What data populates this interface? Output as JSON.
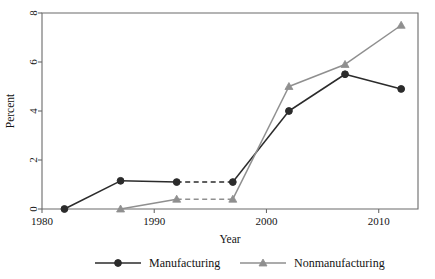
{
  "chart_data": {
    "type": "line",
    "title": "",
    "subtitle": "",
    "xlabel": "Year",
    "ylabel": "Percent",
    "xlim": [
      1980.0,
      2013.5
    ],
    "ylim": [
      0,
      8
    ],
    "xticks": [
      1980,
      1990,
      2000,
      2010
    ],
    "xtick_labels": [
      "1980",
      "1990",
      "2000",
      "2010"
    ],
    "yticks": [
      0,
      2,
      4,
      6,
      8
    ],
    "ytick_labels": [
      "0",
      "2",
      "4",
      "6",
      "8"
    ],
    "grid": false,
    "legend_position": "bottom-outside",
    "series": [
      {
        "name": "Manufacturing",
        "color": "#2b2b2b",
        "marker": "circle",
        "x": [
          1982,
          1987,
          1992,
          1997,
          2002,
          2007,
          2012
        ],
        "values": [
          0.0,
          1.15,
          1.1,
          1.1,
          4.0,
          5.5,
          4.9
        ],
        "dashed_segments": [
          [
            1992,
            1997
          ]
        ]
      },
      {
        "name": "Nonmanufacturing",
        "color": "#8f8f8f",
        "marker": "triangle",
        "x": [
          1987,
          1992,
          1997,
          2002,
          2007,
          2012
        ],
        "values": [
          0.0,
          0.4,
          0.4,
          5.0,
          5.9,
          7.5
        ],
        "dashed_segments": [
          [
            1992,
            1997
          ]
        ]
      }
    ]
  },
  "legend": {
    "entries": [
      {
        "label": "Manufacturing",
        "color": "#2b2b2b",
        "marker": "circle"
      },
      {
        "label": "Nonmanufacturing",
        "color": "#8f8f8f",
        "marker": "triangle"
      }
    ]
  },
  "axes": {
    "x_title": "Year",
    "y_title": "Percent"
  }
}
